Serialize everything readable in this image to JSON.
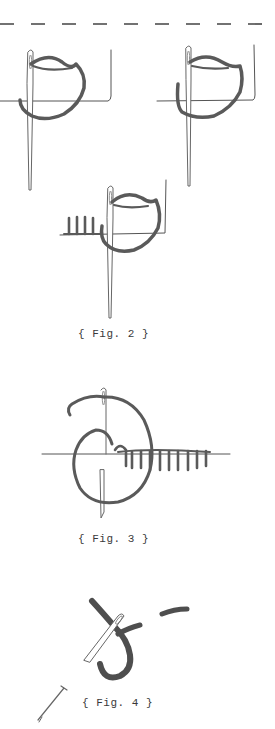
{
  "page": {
    "divider": "dashed-cut-line",
    "colors": {
      "pencil": "#555555",
      "thread": "#5a5a5a",
      "paper": "#ffffff"
    }
  },
  "figures": [
    {
      "id": "fig2",
      "caption": "{ Fig. 2 }",
      "panels": 3,
      "subject": "needle-and-thread-stitch-steps"
    },
    {
      "id": "fig3",
      "caption": "{ Fig. 3 }",
      "subject": "blanket-stitch-along-edge"
    },
    {
      "id": "fig4",
      "caption": "{ Fig. 4 }",
      "subject": "needle-with-thread-loop"
    }
  ]
}
